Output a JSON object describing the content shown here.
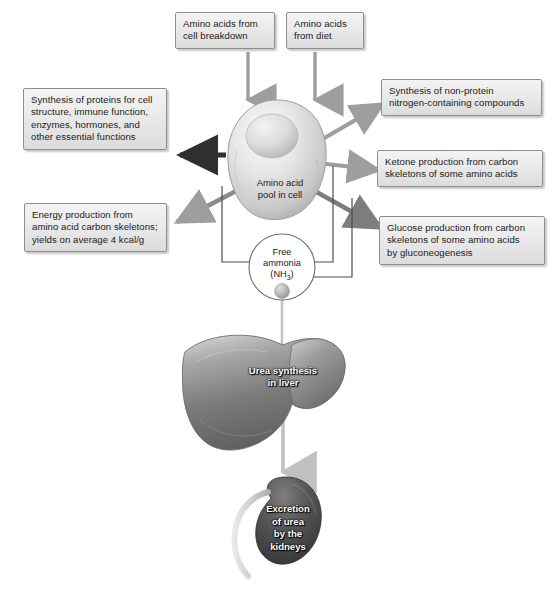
{
  "figure": {
    "canvas": {
      "width": 554,
      "height": 603
    },
    "colors": {
      "box_fill": "#eaeaea",
      "box_border": "#8e8e8e",
      "gray_arrow": "#9a9a9a",
      "dark_gray_arrow": "#7a7a7a",
      "black_arrow": "#2b2b2b",
      "thin_line": "#5a5a5a",
      "organ_label_text": "#ffffff",
      "text": "#1b1b1b"
    }
  },
  "inputs": [
    {
      "id": "amino-acids-cell-breakdown",
      "label": "Amino acids from cell breakdown",
      "line1": "Amino acids from",
      "line2": "cell breakdown"
    },
    {
      "id": "amino-acids-diet",
      "label": "Amino acids from diet",
      "line1": "Amino acids",
      "line2": "from diet"
    }
  ],
  "center": {
    "cell_label_line1": "Amino acid",
    "cell_label_line2": "pool in cell",
    "ammonia_line1": "Free",
    "ammonia_line2": "ammonia",
    "ammonia_formula_prefix": "(NH",
    "ammonia_formula_sub": "3",
    "ammonia_formula_suffix": ")"
  },
  "outputs": {
    "left": [
      {
        "id": "protein-synthesis",
        "label": "Synthesis of proteins for cell structure, immune function, enzymes, hormones, and other essential functions",
        "lines": [
          "Synthesis of proteins for cell",
          "structure, immune function,",
          "enzymes, hormones, and",
          "other essential functions"
        ]
      },
      {
        "id": "energy-production",
        "label": "Energy production from amino acid carbon skeletons; yields on average 4 kcal/g",
        "lines": [
          "Energy production from",
          "amino acid carbon skeletons;",
          "yields on average 4 kcal/g"
        ]
      }
    ],
    "right": [
      {
        "id": "non-protein-nitrogen",
        "label": "Synthesis of non-protein nitrogen-containing compounds",
        "lines": [
          "Synthesis of non-protein",
          "nitrogen-containing compounds"
        ]
      },
      {
        "id": "ketone-production",
        "label": "Ketone production from carbon skeletons of some amino acids",
        "lines": [
          "Ketone production from carbon",
          "skeletons of some amino acids"
        ]
      },
      {
        "id": "glucose-production",
        "label": "Glucose production from carbon skeletons of some amino acids by gluconeogenesis",
        "lines": [
          "Glucose production from carbon",
          "skeletons of some amino acids",
          "by gluconeogenesis"
        ]
      }
    ]
  },
  "organs": [
    {
      "id": "liver",
      "label": "Urea synthesis in liver",
      "line1": "Urea synthesis",
      "line2": "in liver"
    },
    {
      "id": "kidney",
      "label": "Excretion of urea by the kidneys",
      "line1": "Excretion",
      "line2": "of urea",
      "line3": "by the",
      "line4": "kidneys"
    }
  ]
}
